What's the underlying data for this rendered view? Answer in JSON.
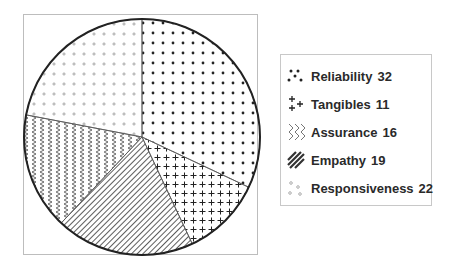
{
  "chart_data": {
    "type": "pie",
    "title": "",
    "categories": [
      "Reliability",
      "Tangibles",
      "Assurance",
      "Empathy",
      "Responsiveness"
    ],
    "values": [
      32,
      11,
      16,
      19,
      22
    ],
    "slice_order_clockwise_from_top": [
      "Reliability",
      "Tangibles",
      "Empathy",
      "Assurance",
      "Responsiveness"
    ],
    "patterns": {
      "Reliability": "dots",
      "Tangibles": "plus",
      "Assurance": "zigzag",
      "Empathy": "diagonal-stripes",
      "Responsiveness": "small-circles"
    },
    "legend_position": "right",
    "grid": false
  },
  "legend": {
    "items": [
      {
        "label": "Reliability",
        "value": "32"
      },
      {
        "label": "Tangibles",
        "value": "11"
      },
      {
        "label": "Assurance",
        "value": "16"
      },
      {
        "label": "Empathy",
        "value": "19"
      },
      {
        "label": "Responsiveness",
        "value": "22"
      }
    ]
  }
}
